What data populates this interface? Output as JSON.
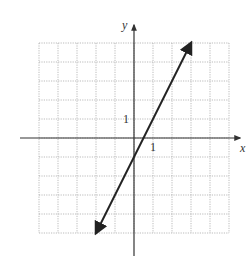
{
  "chart_data": {
    "type": "line",
    "title": "",
    "equation": "y = 2x - 1",
    "xlabel": "x",
    "ylabel": "y",
    "xlim": [
      -5,
      5
    ],
    "ylim": [
      -5,
      5
    ],
    "grid": true,
    "tick_labels": {
      "x": "1",
      "y": "1"
    },
    "series": [
      {
        "name": "line",
        "x": [
          -2,
          3
        ],
        "y": [
          -5,
          5
        ]
      }
    ]
  },
  "labels": {
    "x_axis": "x",
    "y_axis": "y",
    "x_tick": "1",
    "y_tick": "1"
  },
  "colors": {
    "grid": "#aaaaaa",
    "axis": "#333333",
    "line": "#222222"
  }
}
